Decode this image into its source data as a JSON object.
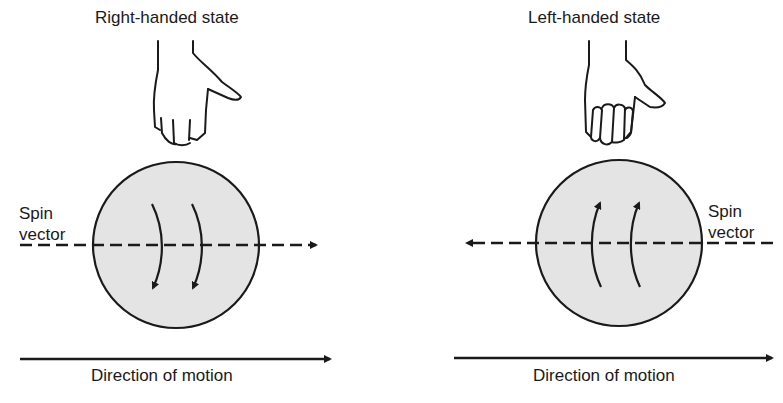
{
  "figure": {
    "panels": [
      {
        "title": "Right-handed state",
        "spin_label_line1": "Spin",
        "spin_label_line2": "vector",
        "caption": "Direction of motion",
        "spin_vector_direction": "right",
        "rotation_arrows_direction": "down",
        "hand": "right-hand-pointing-down"
      },
      {
        "title": "Left-handed state",
        "spin_label_line1": "Spin",
        "spin_label_line2": "vector",
        "caption": "Direction of motion",
        "spin_vector_direction": "left",
        "rotation_arrows_direction": "up",
        "hand": "left-hand-pointing-down"
      }
    ],
    "colors": {
      "ink": "#1a1a1a",
      "sphere_fill": "#e4e4e4",
      "background": "#ffffff"
    }
  }
}
